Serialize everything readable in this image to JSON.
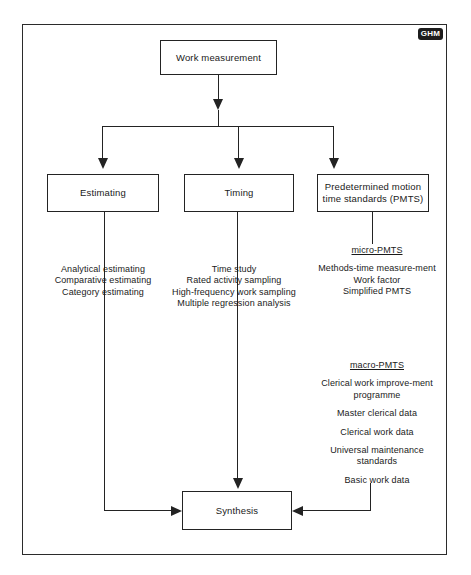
{
  "diagram": {
    "logo": {
      "text": "GHM",
      "name": "ghm-logo"
    },
    "colors": {
      "line": "#232323",
      "box_border": "#232323",
      "background": "#ffffff",
      "logo_background": "#1d1d1d",
      "logo_text": "#ffffff"
    },
    "nodes": {
      "work_measurement": "Work measurement",
      "estimating": "Estimating",
      "timing": "Timing",
      "pmts": "Predetermined motion time standards (PMTS)",
      "synthesis": "Synthesis"
    },
    "lists": {
      "estimating": {
        "heading": "",
        "items": [
          "Analytical estimating",
          "Comparative estimating",
          "Category estimating"
        ]
      },
      "timing": {
        "heading": "",
        "items": [
          "Time study",
          "Rated activity sampling",
          "High-frequency work sampling",
          "Multiple regression analysis"
        ]
      },
      "micro_pmts": {
        "heading": "micro-PMTS",
        "items": [
          "Methods-time measure-ment",
          "Work factor",
          "Simplified PMTS"
        ]
      },
      "macro_pmts": {
        "heading": "macro-PMTS",
        "items": [
          "Clerical work improve-ment programme",
          "Master clerical data",
          "Clerical work data",
          "Universal maintenance standards",
          "Basic work data"
        ]
      }
    },
    "connectors": [
      {
        "name": "work-measurement-to-split",
        "from": "work_measurement",
        "to": "split-bus",
        "style": "arrow-down"
      },
      {
        "name": "split-to-estimating",
        "from": "split-bus",
        "to": "estimating",
        "style": "arrow-down"
      },
      {
        "name": "split-to-timing",
        "from": "split-bus",
        "to": "timing",
        "style": "arrow-down"
      },
      {
        "name": "split-to-pmts",
        "from": "split-bus",
        "to": "pmts",
        "style": "arrow-down"
      },
      {
        "name": "estimating-to-synthesis",
        "from": "estimating",
        "to": "synthesis",
        "style": "arrow-right"
      },
      {
        "name": "timing-to-synthesis",
        "from": "timing",
        "to": "synthesis",
        "style": "arrow-down"
      },
      {
        "name": "pmts-to-synthesis",
        "from": "pmts",
        "to": "synthesis",
        "style": "arrow-left"
      }
    ]
  }
}
